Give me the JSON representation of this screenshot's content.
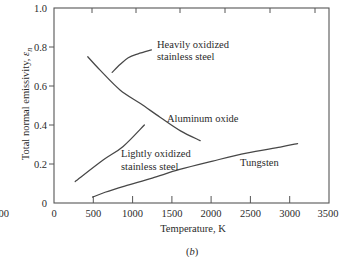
{
  "figure": {
    "panel_label_open": "(",
    "panel_label_letter": "b",
    "panel_label_close": ")",
    "partial_left_tick_label": "00"
  },
  "axes": {
    "xlabel": "Temperature, K",
    "ylabel_text": "Total normal emissivity, ",
    "ylabel_symbol": "ε",
    "ylabel_subscript": "n",
    "x_tick_labels": [
      "0",
      "500",
      "1000",
      "1500",
      "2000",
      "2500",
      "3000",
      "3500"
    ],
    "y_tick_labels": [
      "0",
      "0.2",
      "0.4",
      "0.6",
      "0.8",
      "1.0"
    ]
  },
  "chart_data": {
    "type": "line",
    "title": "",
    "panel": "(b)",
    "xlabel": "Temperature, K",
    "ylabel": "Total normal emissivity, ε_n",
    "xlim": [
      0,
      3500
    ],
    "ylim": [
      0,
      1.0
    ],
    "xticks": [
      0,
      500,
      1000,
      1500,
      2000,
      2500,
      3000,
      3500
    ],
    "yticks": [
      0,
      0.2,
      0.4,
      0.6,
      0.8,
      1.0
    ],
    "grid": false,
    "legend": "inline curve labels",
    "series": [
      {
        "name": "Heavily oxidized stainless steel",
        "label_lines": [
          "Heavily oxidized",
          "stainless steel"
        ],
        "x": [
          740,
          840,
          945,
          1070,
          1240
        ],
        "y": [
          0.67,
          0.71,
          0.745,
          0.765,
          0.785
        ]
      },
      {
        "name": "Aluminum oxide",
        "label_lines": [
          "Aluminum oxide"
        ],
        "x": [
          430,
          590,
          840,
          1100,
          1350,
          1610,
          1860
        ],
        "y": [
          0.75,
          0.68,
          0.58,
          0.51,
          0.44,
          0.37,
          0.32
        ]
      },
      {
        "name": "Lightly oxidized stainless steel",
        "label_lines": [
          "Lightly oxidized",
          "stainless steel"
        ],
        "x": [
          270,
          625,
          880,
          1150
        ],
        "y": [
          0.11,
          0.22,
          0.29,
          0.4
        ]
      },
      {
        "name": "Tungsten",
        "label_lines": [
          "Tungsten"
        ],
        "x": [
          490,
          650,
          900,
          1250,
          1600,
          2020,
          2450,
          2880,
          3100
        ],
        "y": [
          0.03,
          0.055,
          0.087,
          0.128,
          0.172,
          0.215,
          0.256,
          0.287,
          0.305
        ]
      }
    ]
  }
}
